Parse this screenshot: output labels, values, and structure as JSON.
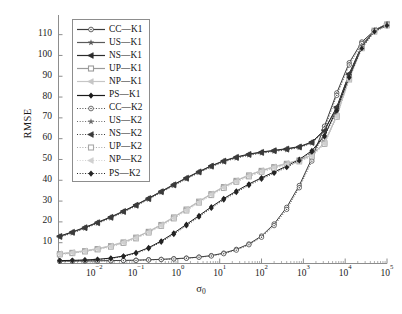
{
  "chart_data": {
    "type": "line",
    "title": "",
    "xlabel": "σ₀",
    "ylabel": "RMSE",
    "xscale": "log",
    "xlim": [
      0.0014,
      100000
    ],
    "ylim": [
      0,
      118
    ],
    "yticks": [
      10,
      20,
      30,
      40,
      50,
      60,
      70,
      80,
      90,
      100,
      110
    ],
    "xticks": [
      0.01,
      0.1,
      1,
      10,
      100,
      1000,
      10000,
      100000
    ],
    "xticklabels": [
      "10⁻²",
      "10⁻¹",
      "10⁰",
      "10¹",
      "10²",
      "10³",
      "10⁴",
      "10⁵"
    ],
    "grid": false,
    "legend_position": "upper-left-inside",
    "x": [
      0.0015,
      0.003,
      0.006,
      0.012,
      0.025,
      0.05,
      0.1,
      0.2,
      0.4,
      0.8,
      1.6,
      3.2,
      6.3,
      12.5,
      25,
      50,
      100,
      200,
      400,
      800,
      1600,
      3200,
      6300,
      12500,
      25000,
      50000,
      100000
    ],
    "series": [
      {
        "name": "CC—K1",
        "label": "CC—K1",
        "marker": "circle-open",
        "linestyle": "solid",
        "color": "#3c3c3c",
        "values": [
          1.2,
          1.2,
          1.3,
          1.3,
          1.4,
          1.5,
          1.6,
          1.8,
          2.0,
          2.3,
          2.6,
          3.1,
          3.8,
          5.0,
          6.8,
          9.4,
          13.2,
          19.0,
          27.0,
          37.5,
          50.5,
          66.0,
          82.0,
          96.5,
          106.5,
          112.0,
          114.5
        ]
      },
      {
        "name": "US—K1",
        "label": "US—K1",
        "marker": "star",
        "linestyle": "solid",
        "color": "#5a5a5a",
        "values": [
          13.0,
          15.0,
          17.2,
          19.6,
          22.2,
          25.0,
          28.0,
          31.2,
          34.5,
          37.8,
          41.0,
          44.0,
          46.8,
          49.2,
          51.0,
          52.4,
          53.4,
          54.2,
          55.0,
          56.0,
          58.2,
          64.0,
          75.0,
          91.0,
          104.5,
          112.0,
          115.0
        ]
      },
      {
        "name": "NS—K1",
        "label": "NS—K1",
        "marker": "triangle-left",
        "linestyle": "solid",
        "color": "#2b2b2b",
        "values": [
          13.2,
          15.2,
          17.4,
          19.8,
          22.4,
          25.2,
          28.2,
          31.4,
          34.7,
          38.0,
          41.2,
          44.2,
          47.0,
          49.4,
          51.2,
          52.6,
          53.6,
          54.4,
          55.2,
          56.2,
          58.4,
          64.2,
          75.2,
          91.2,
          104.7,
          112.2,
          115.2
        ]
      },
      {
        "name": "UP—K1",
        "label": "UP—K1",
        "marker": "square-open",
        "linestyle": "solid",
        "color": "#9b9b9b",
        "values": [
          4.6,
          5.2,
          6.0,
          7.0,
          8.4,
          10.2,
          12.5,
          15.3,
          18.6,
          22.2,
          26.0,
          29.8,
          33.4,
          36.8,
          39.8,
          42.4,
          44.6,
          46.4,
          48.0,
          49.6,
          52.0,
          58.0,
          71.0,
          89.0,
          104.0,
          112.0,
          115.0
        ]
      },
      {
        "name": "NP—K1",
        "label": "NP—K1",
        "marker": "triangle-left-filled",
        "linestyle": "solid",
        "color": "#c6c6c6",
        "values": [
          4.8,
          5.4,
          6.2,
          7.2,
          8.6,
          10.4,
          12.7,
          15.5,
          18.8,
          22.4,
          26.2,
          30.0,
          33.6,
          37.0,
          40.0,
          42.6,
          44.8,
          46.6,
          48.2,
          49.8,
          52.2,
          58.2,
          71.2,
          89.2,
          104.2,
          112.2,
          115.2
        ]
      },
      {
        "name": "PS—K1",
        "label": "PS—K1",
        "marker": "diamond-filled",
        "linestyle": "solid",
        "color": "#1a1a1a",
        "values": [
          1.4,
          1.5,
          1.7,
          2.0,
          2.6,
          3.6,
          5.2,
          7.6,
          10.8,
          14.6,
          18.8,
          23.0,
          27.2,
          31.2,
          34.8,
          38.2,
          41.2,
          44.0,
          46.8,
          50.0,
          54.2,
          61.5,
          74.0,
          90.0,
          104.0,
          112.0,
          115.0
        ]
      },
      {
        "name": "CC—K2",
        "label": "CC—K2",
        "marker": "circle-open",
        "linestyle": "dotted",
        "color": "#4a4a4a",
        "values": [
          1.1,
          1.1,
          1.2,
          1.2,
          1.3,
          1.4,
          1.5,
          1.7,
          1.9,
          2.2,
          2.5,
          3.0,
          3.6,
          4.7,
          6.4,
          9.0,
          12.6,
          18.2,
          26.0,
          36.4,
          49.2,
          64.6,
          80.8,
          95.4,
          105.8,
          111.6,
          114.2
        ]
      },
      {
        "name": "US—K2",
        "label": "US—K2",
        "marker": "star",
        "linestyle": "dotted",
        "color": "#6a6a6a",
        "values": [
          12.6,
          14.6,
          16.8,
          19.2,
          21.8,
          24.6,
          27.6,
          30.8,
          34.1,
          37.4,
          40.6,
          43.6,
          46.4,
          48.8,
          50.6,
          52.0,
          53.0,
          53.8,
          54.6,
          55.6,
          57.8,
          63.6,
          74.6,
          90.6,
          104.1,
          111.6,
          114.6
        ]
      },
      {
        "name": "NS—K2",
        "label": "NS—K2",
        "marker": "triangle-left",
        "linestyle": "dotted",
        "color": "#3a3a3a",
        "values": [
          12.8,
          14.8,
          17.0,
          19.4,
          22.0,
          24.8,
          27.8,
          31.0,
          34.3,
          37.6,
          40.8,
          43.8,
          46.6,
          49.0,
          50.8,
          52.2,
          53.2,
          54.0,
          54.8,
          55.8,
          58.0,
          63.8,
          74.8,
          90.8,
          104.3,
          111.8,
          114.8
        ]
      },
      {
        "name": "UP—K2",
        "label": "UP—K2",
        "marker": "square-open",
        "linestyle": "dotted",
        "color": "#a8a8a8",
        "values": [
          4.3,
          4.9,
          5.7,
          6.7,
          8.0,
          9.8,
          12.0,
          14.8,
          18.0,
          21.6,
          25.4,
          29.2,
          32.8,
          36.2,
          39.2,
          41.8,
          44.0,
          45.8,
          47.4,
          49.0,
          51.4,
          57.4,
          70.4,
          88.4,
          103.4,
          111.4,
          114.4
        ]
      },
      {
        "name": "NP—K2",
        "label": "NP—K2",
        "marker": "triangle-left-filled",
        "linestyle": "dotted",
        "color": "#d0d0d0",
        "values": [
          4.5,
          5.1,
          5.9,
          6.9,
          8.2,
          10.0,
          12.2,
          15.0,
          18.2,
          21.8,
          25.6,
          29.4,
          33.0,
          36.4,
          39.4,
          42.0,
          44.2,
          46.0,
          47.6,
          49.2,
          51.6,
          57.6,
          70.6,
          88.6,
          103.6,
          111.6,
          114.6
        ]
      },
      {
        "name": "PS—K2",
        "label": "PS—K2",
        "marker": "diamond-filled",
        "linestyle": "dotted",
        "color": "#242424",
        "values": [
          1.3,
          1.4,
          1.6,
          1.9,
          2.4,
          3.4,
          4.9,
          7.2,
          10.3,
          14.0,
          18.2,
          22.4,
          26.6,
          30.6,
          34.2,
          37.6,
          40.6,
          43.4,
          46.2,
          49.4,
          53.6,
          60.9,
          73.4,
          89.4,
          103.4,
          111.4,
          114.4
        ]
      }
    ]
  },
  "legend": {
    "items": [
      {
        "label": "CC—K1"
      },
      {
        "label": "US—K1"
      },
      {
        "label": "NS—K1"
      },
      {
        "label": "UP—K1"
      },
      {
        "label": "NP—K1"
      },
      {
        "label": "PS—K1"
      },
      {
        "label": "CC—K2"
      },
      {
        "label": "US—K2"
      },
      {
        "label": "NS—K2"
      },
      {
        "label": "UP—K2"
      },
      {
        "label": "NP—K2"
      },
      {
        "label": "PS—K2"
      }
    ]
  },
  "axes": {
    "ylabel": "RMSE",
    "xlabel_base": "σ",
    "xlabel_sub": "0",
    "yticklabels": [
      "110",
      "100",
      "90",
      "80",
      "70",
      "60",
      "50",
      "40",
      "30",
      "20",
      "10"
    ],
    "xticklabels": [
      {
        "base": "10",
        "exp": "−2"
      },
      {
        "base": "10",
        "exp": "−1"
      },
      {
        "base": "10",
        "exp": "0"
      },
      {
        "base": "10",
        "exp": "1"
      },
      {
        "base": "10",
        "exp": "2"
      },
      {
        "base": "10",
        "exp": "3"
      },
      {
        "base": "10",
        "exp": "4"
      },
      {
        "base": "10",
        "exp": "5"
      }
    ]
  },
  "style": {
    "axis_color": "#8d8d8d",
    "text_color": "#1a1a1a"
  }
}
